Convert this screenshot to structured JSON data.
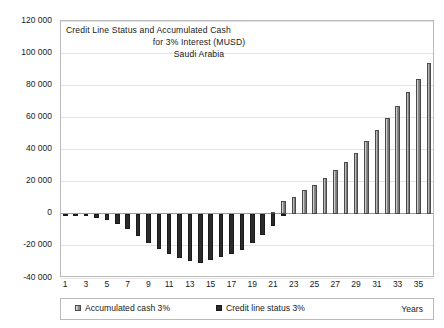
{
  "chart_data": {
    "type": "bar",
    "title": "Credit Line Status and Accumulated Cash for 3% Interest (MUSD) Saudi Arabia",
    "title_lines": [
      "Credit Line Status and Accumulated Cash",
      "for 3%   Interest (MUSD)",
      "Saudi Arabia"
    ],
    "xlabel": "Years",
    "ylabel": "",
    "ylim": [
      -40000,
      120000
    ],
    "ytick_values": [
      120000,
      100000,
      80000,
      60000,
      40000,
      20000,
      0,
      -20000,
      -40000
    ],
    "ytick_labels": [
      "120 000",
      "100 000",
      "80 000",
      "60 000",
      "40 000",
      "20 000",
      "0",
      "-20 000",
      "-40 000"
    ],
    "grid": true,
    "legend_position": "bottom",
    "x": [
      1,
      2,
      3,
      4,
      5,
      6,
      7,
      8,
      9,
      10,
      11,
      12,
      13,
      14,
      15,
      16,
      17,
      18,
      19,
      20,
      21,
      22,
      23,
      24,
      25,
      26,
      27,
      28,
      29,
      30,
      31,
      32,
      33,
      34,
      35,
      36
    ],
    "xtick_labels": [
      "1",
      "3",
      "5",
      "7",
      "9",
      "11",
      "13",
      "15",
      "17",
      "19",
      "21",
      "23",
      "25",
      "27",
      "29",
      "31",
      "33",
      "35"
    ],
    "series": [
      {
        "name": "Credit line status 3%",
        "color": "#2b2b2b",
        "values": [
          -400,
          -900,
          -1600,
          -2600,
          -4200,
          -6200,
          -9300,
          -13800,
          -18500,
          -22000,
          -25300,
          -27500,
          -29500,
          -30600,
          -29000,
          -27000,
          -25300,
          -22500,
          -18500,
          -13500,
          -7500,
          -800,
          0,
          0,
          0,
          0,
          0,
          0,
          0,
          0,
          0,
          0,
          0,
          0,
          0,
          0
        ]
      },
      {
        "name": "Accumulated cash 3%",
        "color": "#8f8f8f",
        "values": [
          0,
          0,
          0,
          0,
          0,
          0,
          0,
          0,
          0,
          0,
          0,
          0,
          0,
          0,
          0,
          0,
          0,
          0,
          0,
          0,
          800,
          8000,
          10500,
          14500,
          18000,
          22000,
          27000,
          32500,
          38000,
          45000,
          52000,
          59500,
          67000,
          75500,
          84000,
          94000
        ]
      }
    ],
    "peak_positive": 103000,
    "trough_negative": -30600
  },
  "legend": {
    "accumulated_label": "Accumulated cash 3%",
    "credit_label": "Credit line status 3%",
    "xaxis_label": "Years"
  }
}
